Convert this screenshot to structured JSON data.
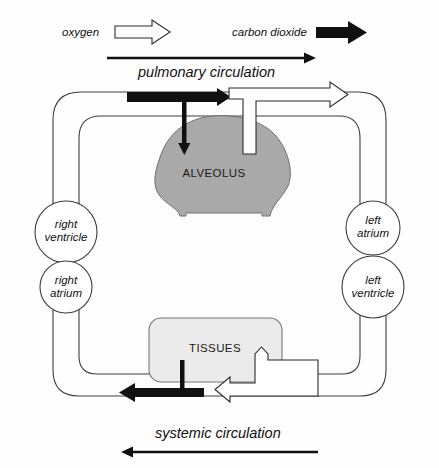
{
  "diagram": {
    "legend": {
      "oxygen": {
        "label": "oxygen",
        "icon": "open-arrow-right-icon",
        "style": "open",
        "color": "#ffffff"
      },
      "carbon_dioxide": {
        "label": "carbon dioxide",
        "icon": "solid-arrow-right-icon",
        "style": "solid",
        "color": "#111111"
      }
    },
    "circulation_labels": {
      "pulmonary": {
        "label": "pulmonary circulation",
        "direction": "right",
        "arrow_color": "#111111"
      },
      "systemic": {
        "label": "systemic circulation",
        "direction": "left",
        "arrow_color": "#111111"
      }
    },
    "organs": {
      "alveolus": {
        "label": "ALVEOLUS",
        "fill": "#a9a9a9"
      },
      "tissues": {
        "label": "TISSUES",
        "fill": "#ebebeb"
      }
    },
    "heart_chambers": [
      {
        "id": "right-ventricle",
        "label_line1": "right",
        "label_line2": "ventricle",
        "side": "left",
        "position": "upper"
      },
      {
        "id": "right-atrium",
        "label_line1": "right",
        "label_line2": "atrium",
        "side": "left",
        "position": "lower"
      },
      {
        "id": "left-atrium",
        "label_line1": "left",
        "label_line2": "atrium",
        "side": "right",
        "position": "upper"
      },
      {
        "id": "left-ventricle",
        "label_line1": "left",
        "label_line2": "ventricle",
        "side": "right",
        "position": "lower"
      }
    ],
    "gas_flows": [
      {
        "id": "co2-to-alveolus",
        "gas": "carbon dioxide",
        "style": "solid",
        "from": "blood",
        "to": "alveolus"
      },
      {
        "id": "o2-from-alveolus",
        "gas": "oxygen",
        "style": "open",
        "from": "alveolus",
        "to": "blood"
      },
      {
        "id": "o2-to-tissues",
        "gas": "oxygen",
        "style": "open",
        "from": "blood",
        "to": "tissues"
      },
      {
        "id": "co2-from-tissues",
        "gas": "carbon dioxide",
        "style": "solid",
        "from": "tissues",
        "to": "blood"
      }
    ],
    "colors": {
      "vessel_stroke": "#3c3c3c",
      "alveolus_fill": "#a9a9a9",
      "tissues_fill": "#ebebeb",
      "dark_arrow": "#111111",
      "background": "#fefefe"
    }
  }
}
